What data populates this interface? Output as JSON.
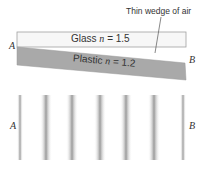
{
  "diagram": {
    "callout": "Thin wedge of air",
    "glass": {
      "material": "Glass",
      "var": "n",
      "eq": "= 1.5"
    },
    "plastic": {
      "material": "Plastic",
      "var": "n",
      "eq": "= 1.2"
    },
    "top_labels": {
      "left": "A",
      "right": "B"
    },
    "bottom_labels": {
      "left": "A",
      "right": "B"
    },
    "fringes": {
      "count": 7,
      "positions_x": [
        20,
        46,
        72,
        100,
        126,
        154,
        183
      ]
    },
    "colors": {
      "glass_fill": "#f7f7f7",
      "plastic_fill": "#a8a8a8",
      "fringe": "#9a9a9a",
      "outline": "#999999"
    }
  }
}
